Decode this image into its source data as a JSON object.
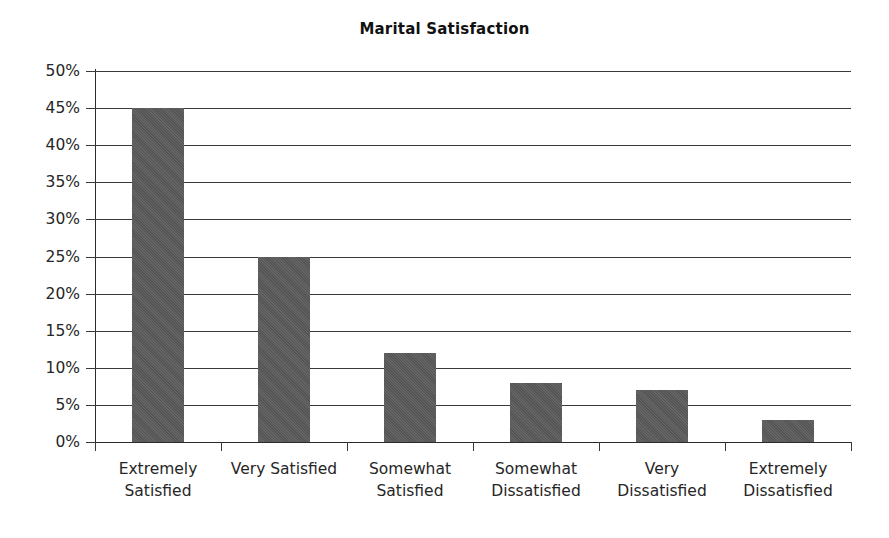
{
  "chart_data": {
    "type": "bar",
    "title": "Marital Satisfaction",
    "xlabel": "",
    "ylabel": "",
    "categories": [
      "Extremely Satisfied",
      "Very Satisfied",
      "Somewhat Satisfied",
      "Somewhat Dissatisfied",
      "Very Dissatisfied",
      "Extremely Dissatisfied"
    ],
    "category_lines": [
      [
        "Extremely",
        "Satisfied"
      ],
      [
        "Very Satisfied",
        ""
      ],
      [
        "Somewhat",
        "Satisfied"
      ],
      [
        "Somewhat",
        "Dissatisfied"
      ],
      [
        "Very",
        "Dissatisfied"
      ],
      [
        "Extremely",
        "Dissatisfied"
      ]
    ],
    "values": [
      45,
      25,
      12,
      8,
      7,
      3
    ],
    "value_unit": "%",
    "ylim": [
      0,
      50
    ],
    "ytick_step": 5,
    "ytick_labels": [
      "50%",
      "45%",
      "40%",
      "35%",
      "30%",
      "25%",
      "20%",
      "15%",
      "10%",
      "5%",
      "0%"
    ],
    "ytick_values": [
      50,
      45,
      40,
      35,
      30,
      25,
      20,
      15,
      10,
      5,
      0
    ],
    "grid": "horizontal",
    "legend": "none",
    "bar_color": "#595959",
    "grid_color": "#3a3a3a",
    "axis_color": "#2b2b2b",
    "background_color": "#ffffff",
    "text_color": "#262626"
  }
}
